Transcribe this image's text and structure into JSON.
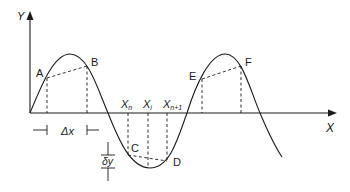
{
  "diagram": {
    "type": "sine-wave-finite-difference",
    "axes": {
      "y_label": "Y",
      "x_label": "X"
    },
    "points": {
      "A": "A",
      "B": "B",
      "C": "C",
      "D": "D",
      "E": "E",
      "F": "F"
    },
    "x_markers": {
      "xn": {
        "base": "X",
        "sub": "n"
      },
      "xi": {
        "base": "X",
        "sub": "i"
      },
      "xn1": {
        "base": "X",
        "sub": "n+1"
      }
    },
    "intervals": {
      "delta_x": "Δx",
      "delta_y_prefix": "δ",
      "delta_y_var": "y"
    },
    "colors": {
      "line": "#1a1a1a",
      "background": "#ffffff"
    }
  }
}
